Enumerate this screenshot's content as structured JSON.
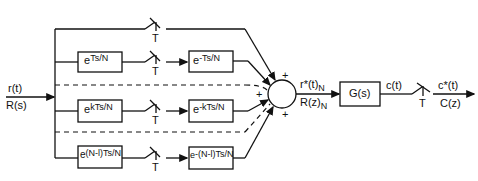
{
  "diagram": {
    "input": {
      "time": "r(t)",
      "laplace": "R(s)"
    },
    "branches": [
      {
        "advance_base": "",
        "advance_exp": "",
        "delay_base": "",
        "delay_exp": "",
        "switch": "T"
      },
      {
        "advance_base": "e",
        "advance_exp": "Ts/N",
        "delay_base": "e",
        "delay_exp": "-Ts/N",
        "switch": "T"
      },
      {
        "advance_base": "e",
        "advance_exp": "kTs/N",
        "delay_base": "e",
        "delay_exp": "-kTs/N",
        "switch": "T"
      },
      {
        "advance_base": "e",
        "advance_exp": "(N-l)Ts/N",
        "delay_base": "e",
        "delay_exp": "-(N-l)Ts/N",
        "switch": "T"
      }
    ],
    "summer_signs": {
      "top": "+",
      "left": "+",
      "bottom": "+"
    },
    "sum_output": {
      "time": "r*(t)",
      "time_sub": "N",
      "z": "R(z)",
      "z_sub": "N"
    },
    "plant": {
      "label": "G(s)"
    },
    "plant_output": "c(t)",
    "output_switch": "T",
    "output": {
      "time": "c*(t)",
      "z": "C(z)"
    }
  }
}
